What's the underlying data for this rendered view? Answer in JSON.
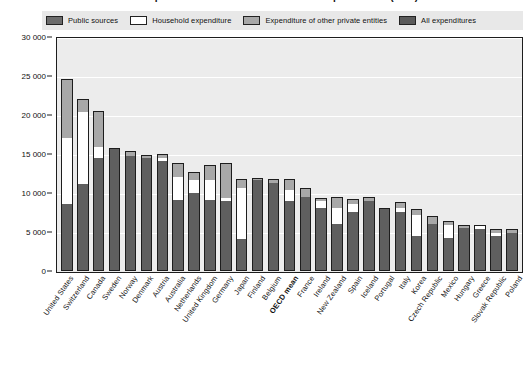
{
  "chart_title": "Annual expenditure on educational institutions per student (USD)",
  "legend": {
    "items": [
      {
        "key": "public",
        "label": "Public sources",
        "color": "#6b6b6b",
        "swatch_class": "sw-public"
      },
      {
        "key": "household",
        "label": "Household expenditure",
        "color": "#ffffff",
        "swatch_class": "sw-household"
      },
      {
        "key": "other",
        "label": "Expenditure of other private entities",
        "color": "#a8a8a8",
        "swatch_class": "sw-other"
      },
      {
        "key": "all",
        "label": "All expenditures",
        "color": "#5a5a5a",
        "swatch_class": "sw-all"
      }
    ]
  },
  "y_axis": {
    "ticks": [
      "30 000",
      "25 000",
      "20 000",
      "15 000",
      "10 000",
      "5 000",
      "0"
    ],
    "values": [
      30000,
      25000,
      20000,
      15000,
      10000,
      5000,
      0
    ]
  },
  "chart_data": {
    "type": "bar",
    "title": "Annual expenditure on educational institutions per student (USD)",
    "xlabel": "",
    "ylabel": "",
    "ylim": [
      0,
      30000
    ],
    "grid": true,
    "stacked": true,
    "legend_position": "top",
    "categories": [
      "United States",
      "Switzerland",
      "Canada",
      "Sweden",
      "Norway",
      "Denmark",
      "Austria",
      "Australia",
      "Netherlands",
      "United Kingdom",
      "Germany",
      "Japan",
      "Finland",
      "Belgium",
      "OECD mean",
      "France",
      "Ireland",
      "New Zealand",
      "Spain",
      "Iceland",
      "Portugal",
      "Italy",
      "Korea",
      "Czech Republic",
      "Mexico",
      "Hungary",
      "Greece",
      "Slovak Republic",
      "Poland"
    ],
    "highlight_category": "OECD mean",
    "series": [
      {
        "name": "Public sources",
        "color": "#5f5f5f",
        "values": [
          8500,
          11000,
          14300,
          15500,
          14600,
          14300,
          14000,
          9000,
          9900,
          9000,
          8900,
          4000,
          11500,
          11200,
          8800,
          9400,
          8000,
          5900,
          7500,
          8900,
          7800,
          7500,
          4400,
          5900,
          4100,
          5400,
          5300,
          4300,
          4800
        ]
      },
      {
        "name": "Household expenditure",
        "color": "#ffffff",
        "values": [
          8400,
          9200,
          1500,
          0,
          0,
          0,
          300,
          2900,
          1600,
          2500,
          300,
          6500,
          0,
          0,
          1500,
          0,
          900,
          2100,
          1000,
          0,
          0,
          400,
          2600,
          0,
          1700,
          0,
          300,
          500,
          0
        ]
      },
      {
        "name": "Expenditure of other private entities",
        "color": "#a8a8a8",
        "values": [
          7500,
          1600,
          4400,
          0,
          500,
          300,
          400,
          1700,
          1000,
          1900,
          4400,
          1100,
          200,
          400,
          1300,
          1000,
          200,
          1200,
          500,
          300,
          0,
          700,
          700,
          900,
          400,
          200,
          0,
          300,
          300
        ]
      }
    ],
    "totals": [
      24400,
      21800,
      20200,
      15500,
      15100,
      14600,
      14700,
      13600,
      12500,
      13400,
      13600,
      11600,
      11700,
      11600,
      11600,
      10400,
      9100,
      9200,
      9000,
      9200,
      7800,
      8600,
      7700,
      6800,
      6200,
      5600,
      5600,
      5100,
      5100
    ],
    "value_unit": "USD converted using PPPs"
  },
  "x_labels": [
    {
      "text": "United States",
      "highlight": false
    },
    {
      "text": "Switzerland",
      "highlight": false
    },
    {
      "text": "Canada",
      "highlight": false
    },
    {
      "text": "Sweden",
      "highlight": false
    },
    {
      "text": "Norway",
      "highlight": false
    },
    {
      "text": "Denmark",
      "highlight": false
    },
    {
      "text": "Austria",
      "highlight": false
    },
    {
      "text": "Australia",
      "highlight": false
    },
    {
      "text": "Netherlands",
      "highlight": false
    },
    {
      "text": "United Kingdom",
      "highlight": false
    },
    {
      "text": "Germany",
      "highlight": false
    },
    {
      "text": "Japan",
      "highlight": false
    },
    {
      "text": "Finland",
      "highlight": false
    },
    {
      "text": "Belgium",
      "highlight": false
    },
    {
      "text": "OECD mean",
      "highlight": true
    },
    {
      "text": "France",
      "highlight": false
    },
    {
      "text": "Ireland",
      "highlight": false
    },
    {
      "text": "New Zealand",
      "highlight": false
    },
    {
      "text": "Spain",
      "highlight": false
    },
    {
      "text": "Iceland",
      "highlight": false
    },
    {
      "text": "Portugal",
      "highlight": false
    },
    {
      "text": "Italy",
      "highlight": false
    },
    {
      "text": "Korea",
      "highlight": false
    },
    {
      "text": "Czech Republic",
      "highlight": false
    },
    {
      "text": "Mexico",
      "highlight": false
    },
    {
      "text": "Hungary",
      "highlight": false
    },
    {
      "text": "Greece",
      "highlight": false
    },
    {
      "text": "Slovak Republic",
      "highlight": false
    },
    {
      "text": "Poland",
      "highlight": false
    }
  ]
}
